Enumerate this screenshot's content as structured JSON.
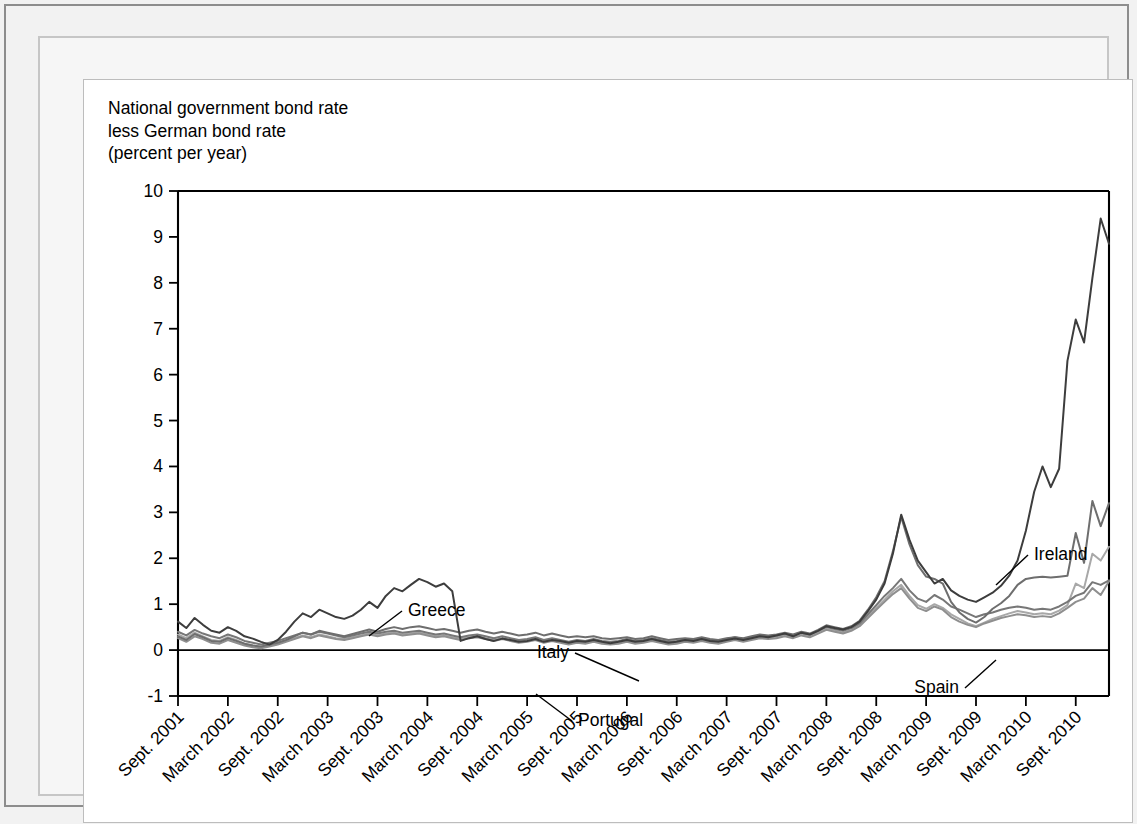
{
  "figure": {
    "axis_title": "National government bond rate\nless German bond rate\n(percent per year)"
  },
  "chart_data": {
    "type": "line",
    "title": "National government bond rate less German bond rate (percent per year)",
    "xlabel": "",
    "ylabel": "National government bond rate less German bond rate (percent per year)",
    "ylim": [
      -1,
      10
    ],
    "yticks": [
      -1,
      0,
      1,
      2,
      3,
      4,
      5,
      6,
      7,
      8,
      9,
      10
    ],
    "ytick_labels": [
      "-1",
      "0",
      "1",
      "2",
      "3",
      "4",
      "5",
      "6",
      "7",
      "8",
      "9",
      "10"
    ],
    "grid": false,
    "legend_position": "inline-annotations",
    "zero_line": true,
    "x_start": "Sept. 2001",
    "x_end": "Sept. 2010",
    "x_step_months": 1,
    "xtick_labels": [
      "Sept. 2001",
      "March 2002",
      "Sept. 2002",
      "March 2003",
      "Sept. 2003",
      "March 2004",
      "Sept. 2004",
      "March 2005",
      "Sept. 2005",
      "March 2006",
      "Sept. 2006",
      "March 2007",
      "Sept. 2007",
      "March 2008",
      "Sept. 2008",
      "March 2009",
      "Sept. 2009",
      "March 2010",
      "Sept. 2010"
    ],
    "xtick_index": [
      0,
      6,
      12,
      18,
      24,
      30,
      36,
      42,
      48,
      54,
      60,
      66,
      72,
      78,
      84,
      90,
      96,
      102,
      108
    ],
    "annotations": [
      {
        "text": "Greece",
        "x_index": 20,
        "y": 1.6,
        "label_px": [
          318,
          531
        ],
        "leader_to_px": [
          285,
          556
        ]
      },
      {
        "text": "Italy",
        "x_index": 56,
        "y": 0.72,
        "label_px": [
          491,
          573
        ],
        "leader_to_px": [
          555,
          601
        ]
      },
      {
        "text": "Portugal",
        "x_index": 56,
        "y": -0.35,
        "label_px": [
          488,
          641
        ],
        "leader_to_px": [
          452,
          614
        ]
      },
      {
        "text": "Ireland",
        "x_index": 88,
        "y": 2.55,
        "label_px": [
          944,
          475
        ],
        "leader_to_px": [
          912,
          505
        ]
      },
      {
        "text": "Spain",
        "x_index": 89,
        "y": 0.42,
        "label_px": [
          881,
          608
        ],
        "leader_to_px": [
          912,
          580
        ]
      }
    ],
    "series": [
      {
        "name": "Greece",
        "color": "#3d3d3d",
        "values": [
          0.62,
          0.48,
          0.7,
          0.55,
          0.42,
          0.38,
          0.5,
          0.42,
          0.3,
          0.25,
          0.18,
          0.12,
          0.22,
          0.4,
          0.62,
          0.8,
          0.72,
          0.88,
          0.8,
          0.72,
          0.68,
          0.75,
          0.88,
          1.05,
          0.92,
          1.18,
          1.35,
          1.28,
          1.42,
          1.55,
          1.48,
          1.38,
          1.45,
          1.28,
          0.2,
          0.26,
          0.3,
          0.24,
          0.2,
          0.25,
          0.22,
          0.18,
          0.2,
          0.24,
          0.18,
          0.22,
          0.2,
          0.16,
          0.2,
          0.18,
          0.22,
          0.18,
          0.15,
          0.18,
          0.22,
          0.18,
          0.2,
          0.24,
          0.2,
          0.16,
          0.18,
          0.22,
          0.2,
          0.24,
          0.2,
          0.18,
          0.22,
          0.25,
          0.22,
          0.26,
          0.3,
          0.28,
          0.32,
          0.36,
          0.3,
          0.38,
          0.34,
          0.42,
          0.52,
          0.48,
          0.45,
          0.5,
          0.62,
          0.85,
          1.1,
          1.45,
          2.1,
          2.95,
          2.4,
          1.95,
          1.7,
          1.45,
          1.55,
          1.3,
          1.18,
          1.1,
          1.05,
          1.15,
          1.25,
          1.4,
          1.62,
          1.95,
          2.6,
          3.45,
          4.0,
          3.55,
          3.95,
          6.3,
          7.2,
          6.7,
          8.1,
          9.4,
          8.85
        ]
      },
      {
        "name": "Ireland",
        "color": "#6e6e6e",
        "values": [
          0.3,
          0.22,
          0.35,
          0.28,
          0.2,
          0.18,
          0.26,
          0.2,
          0.14,
          0.1,
          0.08,
          0.12,
          0.16,
          0.22,
          0.3,
          0.38,
          0.34,
          0.42,
          0.38,
          0.34,
          0.3,
          0.35,
          0.4,
          0.45,
          0.4,
          0.46,
          0.5,
          0.46,
          0.5,
          0.52,
          0.48,
          0.44,
          0.46,
          0.42,
          0.38,
          0.42,
          0.45,
          0.4,
          0.36,
          0.4,
          0.36,
          0.32,
          0.34,
          0.38,
          0.32,
          0.36,
          0.32,
          0.28,
          0.3,
          0.28,
          0.3,
          0.26,
          0.24,
          0.26,
          0.28,
          0.24,
          0.26,
          0.3,
          0.26,
          0.22,
          0.24,
          0.26,
          0.24,
          0.28,
          0.24,
          0.22,
          0.26,
          0.28,
          0.26,
          0.3,
          0.34,
          0.32,
          0.34,
          0.38,
          0.34,
          0.4,
          0.36,
          0.44,
          0.54,
          0.5,
          0.46,
          0.52,
          0.64,
          0.88,
          1.15,
          1.5,
          2.15,
          2.9,
          2.3,
          1.85,
          1.6,
          1.55,
          1.45,
          1.05,
          0.82,
          0.68,
          0.6,
          0.72,
          0.9,
          1.02,
          1.18,
          1.42,
          1.55,
          1.58,
          1.6,
          1.58,
          1.6,
          1.62,
          2.55,
          1.9,
          3.25,
          2.7,
          3.2
        ]
      },
      {
        "name": "Italy",
        "color": "#777777",
        "values": [
          0.4,
          0.32,
          0.44,
          0.36,
          0.3,
          0.26,
          0.34,
          0.28,
          0.2,
          0.16,
          0.12,
          0.16,
          0.2,
          0.26,
          0.32,
          0.38,
          0.34,
          0.4,
          0.36,
          0.32,
          0.28,
          0.32,
          0.36,
          0.4,
          0.36,
          0.4,
          0.42,
          0.38,
          0.4,
          0.42,
          0.38,
          0.34,
          0.36,
          0.32,
          0.28,
          0.32,
          0.34,
          0.3,
          0.26,
          0.3,
          0.26,
          0.22,
          0.24,
          0.28,
          0.22,
          0.26,
          0.22,
          0.18,
          0.22,
          0.2,
          0.24,
          0.2,
          0.18,
          0.2,
          0.24,
          0.2,
          0.22,
          0.26,
          0.22,
          0.18,
          0.2,
          0.24,
          0.22,
          0.26,
          0.22,
          0.2,
          0.24,
          0.28,
          0.24,
          0.28,
          0.32,
          0.3,
          0.32,
          0.36,
          0.32,
          0.38,
          0.34,
          0.42,
          0.5,
          0.46,
          0.42,
          0.48,
          0.58,
          0.78,
          0.98,
          1.18,
          1.35,
          1.55,
          1.3,
          1.12,
          1.05,
          1.2,
          1.1,
          0.95,
          0.88,
          0.8,
          0.72,
          0.78,
          0.82,
          0.88,
          0.92,
          0.95,
          0.92,
          0.88,
          0.9,
          0.88,
          0.95,
          1.05,
          1.18,
          1.25,
          1.48,
          1.42,
          1.52
        ]
      },
      {
        "name": "Spain",
        "color": "#8f8f8f",
        "values": [
          0.26,
          0.18,
          0.3,
          0.24,
          0.16,
          0.14,
          0.22,
          0.16,
          0.1,
          0.06,
          0.04,
          0.08,
          0.12,
          0.18,
          0.24,
          0.3,
          0.26,
          0.32,
          0.28,
          0.24,
          0.22,
          0.26,
          0.3,
          0.34,
          0.3,
          0.34,
          0.36,
          0.32,
          0.34,
          0.36,
          0.32,
          0.28,
          0.3,
          0.26,
          0.22,
          0.26,
          0.28,
          0.24,
          0.2,
          0.24,
          0.2,
          0.16,
          0.18,
          0.22,
          0.16,
          0.2,
          0.16,
          0.12,
          0.16,
          0.14,
          0.18,
          0.14,
          0.12,
          0.14,
          0.18,
          0.14,
          0.16,
          0.2,
          0.16,
          0.12,
          0.14,
          0.18,
          0.16,
          0.2,
          0.16,
          0.14,
          0.18,
          0.22,
          0.18,
          0.22,
          0.26,
          0.24,
          0.26,
          0.3,
          0.26,
          0.32,
          0.28,
          0.36,
          0.44,
          0.4,
          0.36,
          0.42,
          0.52,
          0.7,
          0.88,
          1.05,
          1.22,
          1.35,
          1.12,
          0.92,
          0.85,
          0.95,
          0.88,
          0.72,
          0.62,
          0.55,
          0.5,
          0.58,
          0.64,
          0.7,
          0.74,
          0.78,
          0.76,
          0.72,
          0.74,
          0.72,
          0.8,
          0.92,
          1.05,
          1.12,
          1.35,
          1.2,
          1.5
        ]
      },
      {
        "name": "Portugal",
        "color": "#a8a8a8",
        "values": [
          0.34,
          0.26,
          0.38,
          0.3,
          0.22,
          0.2,
          0.28,
          0.22,
          0.14,
          0.1,
          0.06,
          0.1,
          0.14,
          0.2,
          0.26,
          0.32,
          0.28,
          0.34,
          0.3,
          0.26,
          0.24,
          0.28,
          0.32,
          0.36,
          0.32,
          0.36,
          0.38,
          0.34,
          0.36,
          0.38,
          0.34,
          0.3,
          0.32,
          0.28,
          0.24,
          0.28,
          0.3,
          0.26,
          0.22,
          0.26,
          0.22,
          0.18,
          0.2,
          0.24,
          0.18,
          0.22,
          0.18,
          0.14,
          0.18,
          0.16,
          0.2,
          0.16,
          0.14,
          0.16,
          0.2,
          0.16,
          0.18,
          0.22,
          0.18,
          0.14,
          0.16,
          0.2,
          0.18,
          0.22,
          0.18,
          0.16,
          0.2,
          0.24,
          0.2,
          0.24,
          0.28,
          0.26,
          0.28,
          0.32,
          0.28,
          0.34,
          0.3,
          0.38,
          0.46,
          0.42,
          0.38,
          0.44,
          0.56,
          0.74,
          0.92,
          1.1,
          1.28,
          1.42,
          1.18,
          0.98,
          0.9,
          1.0,
          0.92,
          0.78,
          0.68,
          0.58,
          0.52,
          0.6,
          0.68,
          0.74,
          0.8,
          0.85,
          0.82,
          0.78,
          0.8,
          0.78,
          0.86,
          0.98,
          1.45,
          1.35,
          2.1,
          1.95,
          2.25
        ]
      }
    ]
  }
}
